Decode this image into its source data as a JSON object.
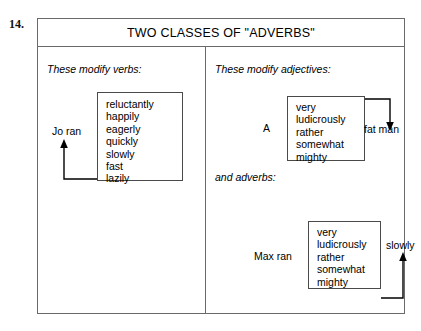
{
  "figure": {
    "number": "14.",
    "title": "TWO CLASSES OF \"ADVERBS\""
  },
  "panels": {
    "left": {
      "heading": "These modify verbs:",
      "subject_label": "Jo ran",
      "words": [
        "reluctantly",
        "happily",
        "eagerly",
        "quickly",
        "slowly",
        "fast",
        "lazily"
      ]
    },
    "right": {
      "adjectives": {
        "heading": "These modify adjectives:",
        "article_label": "A",
        "target_label": "fat man",
        "words": [
          "very",
          "ludicrously",
          "rather",
          "somewhat",
          "mighty"
        ]
      },
      "adverbs": {
        "heading": "and adverbs:",
        "subject_label": "Max ran",
        "target_label": "slowly",
        "words": [
          "very",
          "ludicrously",
          "rather",
          "somewhat",
          "mighty"
        ]
      }
    }
  },
  "colors": {
    "frame": "#6a6a6a",
    "box": "#4a4a4a",
    "arrow": "#000000",
    "text": "#000000",
    "background": "#ffffff"
  }
}
